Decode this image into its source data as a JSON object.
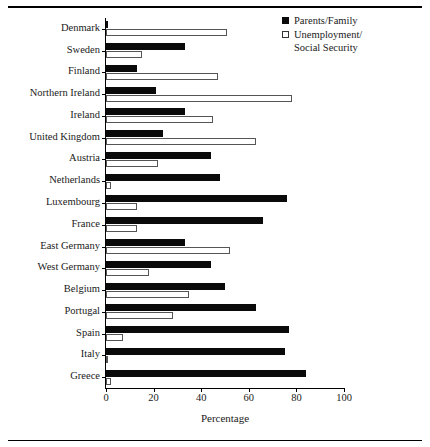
{
  "chart_data": {
    "type": "bar",
    "orientation": "horizontal",
    "title": "",
    "xlabel": "Percentage",
    "ylabel": "",
    "xlim": [
      0,
      100
    ],
    "xticks": [
      0,
      20,
      40,
      60,
      80,
      100
    ],
    "grid": false,
    "legend_position": "top-right",
    "categories": [
      "Denmark",
      "Sweden",
      "Finland",
      "Northern Ireland",
      "Ireland",
      "United Kingdom",
      "Austria",
      "Netherlands",
      "Luxembourg",
      "France",
      "East Germany",
      "West Germany",
      "Belgium",
      "Portugal",
      "Spain",
      "Italy",
      "Greece"
    ],
    "series": [
      {
        "name": "Parents/Family",
        "style": "filled",
        "color": "#0a0a0a",
        "values": [
          0,
          33,
          13,
          21,
          33,
          24,
          44,
          48,
          76,
          66,
          33,
          44,
          50,
          63,
          77,
          75,
          84
        ]
      },
      {
        "name": "Unemployment/\nSocial Security",
        "style": "hollow",
        "color": "#ffffff",
        "values": [
          51,
          15,
          47,
          78,
          45,
          63,
          22,
          2,
          13,
          13,
          52,
          18,
          35,
          28,
          7,
          1,
          2
        ]
      }
    ]
  },
  "legend": {
    "entries": [
      {
        "label": "Parents/Family",
        "swatch": "filled"
      },
      {
        "label": "Unemployment/\nSocial Security",
        "swatch": "hollow"
      }
    ]
  },
  "axis": {
    "x_title": "Percentage",
    "x_tick_labels": [
      "0",
      "20",
      "40",
      "60",
      "80",
      "100"
    ]
  }
}
